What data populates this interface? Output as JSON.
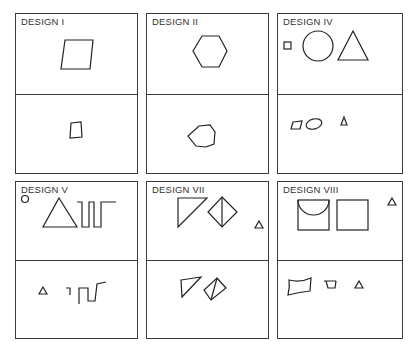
{
  "figure": {
    "panels": [
      {
        "id": "design-1",
        "title": "DESIGN I",
        "top_shapes": [
          "parallelogram"
        ],
        "bottom_shapes": [
          "small-parallelogram"
        ]
      },
      {
        "id": "design-2",
        "title": "DESIGN II",
        "top_shapes": [
          "hexagon"
        ],
        "bottom_shapes": [
          "small-irregular-hexagon"
        ]
      },
      {
        "id": "design-4",
        "title": "DESIGN IV",
        "top_shapes": [
          "small-square",
          "circle",
          "triangle"
        ],
        "bottom_shapes": [
          "small-parallelogram",
          "ellipse",
          "small-triangle"
        ]
      },
      {
        "id": "design-5",
        "title": "DESIGN V",
        "top_shapes": [
          "small-circle",
          "triangle",
          "square-wave"
        ],
        "bottom_shapes": [
          "small-triangle",
          "square-wave-fragment"
        ]
      },
      {
        "id": "design-7",
        "title": "DESIGN VII",
        "top_shapes": [
          "right-triangle",
          "diamond-with-diagonal",
          "small-triangle"
        ],
        "bottom_shapes": [
          "skewed-triangle",
          "skewed-diamond-with-diagonal"
        ]
      },
      {
        "id": "design-8",
        "title": "DESIGN VIII",
        "top_shapes": [
          "square-with-arc",
          "square",
          "small-triangle"
        ],
        "bottom_shapes": [
          "distorted-quadrilateral",
          "trapezoid",
          "small-triangle"
        ]
      }
    ]
  }
}
